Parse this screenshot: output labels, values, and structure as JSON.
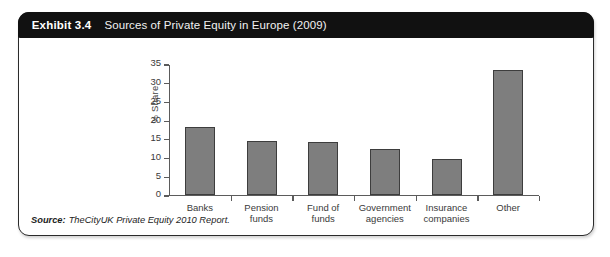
{
  "exhibit": {
    "number_label": "Exhibit 3.4",
    "title": "Sources of Private Equity in Europe (2009)"
  },
  "source": {
    "key": "Source:",
    "value": "TheCityUK Private Equity 2010 Report."
  },
  "colors": {
    "header_bg": "#111111",
    "header_text": "#ffffff",
    "bar_fill": "#7e7e7e",
    "bar_stroke": "#3d3d3d",
    "axis": "#5b5b5b",
    "card_border": "#2b2b2b"
  },
  "chart_data": {
    "type": "bar",
    "title": "Sources of Private Equity in Europe (2009)",
    "categories": [
      "Banks",
      "Pension funds",
      "Fund of funds",
      "Government agencies",
      "Insurance companies",
      "Other"
    ],
    "category_labels": [
      "Banks",
      "Pension\nfunds",
      "Fund of\nfunds",
      "Government\nagencies",
      "Insurance\ncompanies",
      "Other"
    ],
    "values": [
      18.0,
      14.3,
      14.2,
      12.3,
      9.5,
      33.4
    ],
    "xlabel": "",
    "ylabel": "% Share",
    "ylim": [
      0,
      35
    ],
    "yticks": [
      0,
      5,
      10,
      15,
      20,
      25,
      30,
      35
    ],
    "ytick_labels": [
      "0",
      "5",
      "10",
      "15",
      "20",
      "25",
      "30",
      "35"
    ],
    "grid": false,
    "legend": false
  }
}
